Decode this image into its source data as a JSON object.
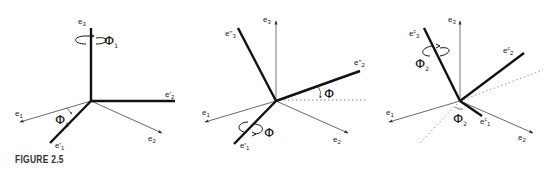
{
  "figure": {
    "caption": "FIGURE 2.5",
    "panels": [
      {
        "id": "rotation-1",
        "axes_thin": [
          "e1",
          "e2"
        ],
        "axes_thick": [
          "e3",
          "e'1",
          "e'2"
        ],
        "labels": {
          "e3": {
            "base": "e",
            "sup": "",
            "sub": "3"
          },
          "e1": {
            "base": "e",
            "sup": "",
            "sub": "1"
          },
          "e2": {
            "base": "e",
            "sup": "",
            "sub": "2"
          },
          "ep1": {
            "base": "e",
            "sup": "'",
            "sub": "1"
          },
          "ep2": {
            "base": "e",
            "sup": "'",
            "sub": "2"
          }
        },
        "rotation_axis": "e3",
        "angle_label": {
          "base": "Φ",
          "sub": "1"
        },
        "angle_between": [
          "e1",
          "e'1"
        ]
      },
      {
        "id": "rotation-2",
        "axes_thin": [
          "e1",
          "e2",
          "e3"
        ],
        "axes_thick": [
          "e'1",
          "e''2",
          "e''3"
        ],
        "labels": {
          "e3": {
            "base": "e",
            "sup": "",
            "sub": "3"
          },
          "e1": {
            "base": "e",
            "sup": "",
            "sub": "1"
          },
          "e2": {
            "base": "e",
            "sup": "",
            "sub": "2"
          },
          "ep1": {
            "base": "e",
            "sup": "'",
            "sub": "1"
          },
          "epp2": {
            "base": "e",
            "sup": "''",
            "sub": "2"
          },
          "epp3": {
            "base": "e",
            "sup": "''",
            "sub": "3"
          }
        },
        "rotation_axis": "e'1",
        "angle_label": {
          "base": "Φ",
          "sub": ""
        },
        "angle_between": [
          "e'2 (dotted)",
          "e''2"
        ]
      },
      {
        "id": "rotation-3",
        "axes_thin": [
          "e1",
          "e2",
          "e3"
        ],
        "axes_thick": [
          "ec1",
          "ec2",
          "ec3"
        ],
        "labels": {
          "e3": {
            "base": "e",
            "sup": "",
            "sub": "3"
          },
          "e1": {
            "base": "e",
            "sup": "",
            "sub": "1"
          },
          "e2": {
            "base": "e",
            "sup": "",
            "sub": "2"
          },
          "ec1": {
            "base": "e",
            "sup": "c",
            "sub": "1"
          },
          "ec2": {
            "base": "e",
            "sup": "c",
            "sub": "2"
          },
          "ec3": {
            "base": "e",
            "sup": "c",
            "sub": "3"
          }
        },
        "rotation_axis": "ec3",
        "angle_label": {
          "base": "Φ",
          "sub": "2"
        },
        "angle_between": [
          "dotted line",
          "ec1"
        ]
      }
    ]
  }
}
